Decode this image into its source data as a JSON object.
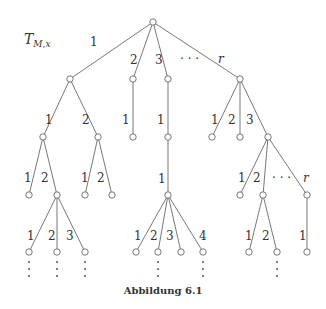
{
  "diagram": {
    "title_main": "T",
    "title_sub": "M,x",
    "caption": "Abbildung 6.1",
    "nodes": [
      {
        "id": "root",
        "x": 153,
        "y": 22
      },
      {
        "id": "a",
        "x": 70,
        "y": 79
      },
      {
        "id": "b",
        "x": 133,
        "y": 79
      },
      {
        "id": "c",
        "x": 168,
        "y": 79
      },
      {
        "id": "d",
        "x": 240,
        "y": 79
      },
      {
        "id": "a1",
        "x": 43,
        "y": 137
      },
      {
        "id": "a2",
        "x": 98,
        "y": 137
      },
      {
        "id": "b1",
        "x": 133,
        "y": 137
      },
      {
        "id": "c1",
        "x": 168,
        "y": 137
      },
      {
        "id": "d1",
        "x": 212,
        "y": 137
      },
      {
        "id": "d2",
        "x": 240,
        "y": 137
      },
      {
        "id": "d3",
        "x": 268,
        "y": 137
      },
      {
        "id": "a11",
        "x": 29,
        "y": 195
      },
      {
        "id": "a12",
        "x": 57,
        "y": 195
      },
      {
        "id": "a21",
        "x": 85,
        "y": 195
      },
      {
        "id": "a22",
        "x": 112,
        "y": 195
      },
      {
        "id": "c11",
        "x": 168,
        "y": 195
      },
      {
        "id": "d31",
        "x": 240,
        "y": 195
      },
      {
        "id": "d32",
        "x": 263,
        "y": 195
      },
      {
        "id": "d3r",
        "x": 307,
        "y": 195
      },
      {
        "id": "a121",
        "x": 29,
        "y": 252
      },
      {
        "id": "a122",
        "x": 57,
        "y": 252
      },
      {
        "id": "a123",
        "x": 85,
        "y": 252
      },
      {
        "id": "c111",
        "x": 136,
        "y": 252
      },
      {
        "id": "c112",
        "x": 158,
        "y": 252
      },
      {
        "id": "c113",
        "x": 181,
        "y": 252
      },
      {
        "id": "c114",
        "x": 203,
        "y": 252
      },
      {
        "id": "d321",
        "x": 249,
        "y": 252
      },
      {
        "id": "d322",
        "x": 277,
        "y": 252
      },
      {
        "id": "d3r1",
        "x": 307,
        "y": 252
      }
    ],
    "edges": [
      {
        "from": "root",
        "to": "a",
        "label": "1",
        "lx": 90,
        "ly": 46
      },
      {
        "from": "root",
        "to": "b",
        "label": "2",
        "lx": 130,
        "ly": 64
      },
      {
        "from": "root",
        "to": "c",
        "label": "3",
        "lx": 155,
        "ly": 64
      },
      {
        "from": "root",
        "to": "d",
        "label": "r",
        "lx": 218,
        "ly": 63,
        "italic": true
      },
      {
        "from": "a",
        "to": "a1",
        "label": "1",
        "lx": 45,
        "ly": 124
      },
      {
        "from": "a",
        "to": "a2",
        "label": "2",
        "lx": 82,
        "ly": 124
      },
      {
        "from": "b",
        "to": "b1",
        "label": "1",
        "lx": 122,
        "ly": 124
      },
      {
        "from": "c",
        "to": "c1",
        "label": "1",
        "lx": 157,
        "ly": 124
      },
      {
        "from": "d",
        "to": "d1",
        "label": "1",
        "lx": 211,
        "ly": 124
      },
      {
        "from": "d",
        "to": "d2",
        "label": "2",
        "lx": 228,
        "ly": 124
      },
      {
        "from": "d",
        "to": "d3",
        "label": "3",
        "lx": 246,
        "ly": 124
      },
      {
        "from": "a1",
        "to": "a11",
        "label": "1",
        "lx": 24,
        "ly": 182
      },
      {
        "from": "a1",
        "to": "a12",
        "label": "2",
        "lx": 41,
        "ly": 182
      },
      {
        "from": "a2",
        "to": "a21",
        "label": "1",
        "lx": 81,
        "ly": 182
      },
      {
        "from": "a2",
        "to": "a22",
        "label": "2",
        "lx": 97,
        "ly": 182
      },
      {
        "from": "c1",
        "to": "c11",
        "label": "1",
        "lx": 158,
        "ly": 183
      },
      {
        "from": "d3",
        "to": "d31",
        "label": "1",
        "lx": 238,
        "ly": 182
      },
      {
        "from": "d3",
        "to": "d32",
        "label": "2",
        "lx": 253,
        "ly": 182
      },
      {
        "from": "d3",
        "to": "d3r",
        "label": "r",
        "lx": 303,
        "ly": 182,
        "italic": true
      },
      {
        "from": "a12",
        "to": "a121",
        "label": "1",
        "lx": 27,
        "ly": 240
      },
      {
        "from": "a12",
        "to": "a122",
        "label": "2",
        "lx": 48,
        "ly": 240
      },
      {
        "from": "a12",
        "to": "a123",
        "label": "3",
        "lx": 66,
        "ly": 240
      },
      {
        "from": "c11",
        "to": "c111",
        "label": "1",
        "lx": 134,
        "ly": 240
      },
      {
        "from": "c11",
        "to": "c112",
        "label": "2",
        "lx": 150,
        "ly": 240
      },
      {
        "from": "c11",
        "to": "c113",
        "label": "3",
        "lx": 166,
        "ly": 240
      },
      {
        "from": "c11",
        "to": "c114",
        "label": "4",
        "lx": 199,
        "ly": 240
      },
      {
        "from": "d32",
        "to": "d321",
        "label": "1",
        "lx": 245,
        "ly": 240
      },
      {
        "from": "d32",
        "to": "d322",
        "label": "2",
        "lx": 262,
        "ly": 240
      },
      {
        "from": "d3r",
        "to": "d3r1",
        "label": "1",
        "lx": 299,
        "ly": 240
      }
    ],
    "ellipses": [
      {
        "text": "· · ·",
        "x": 180,
        "y": 63
      },
      {
        "text": "· · ·",
        "x": 272,
        "y": 182
      }
    ],
    "vdots_at": [
      "a121",
      "a122",
      "a123",
      "c112",
      "c114",
      "d322"
    ]
  }
}
